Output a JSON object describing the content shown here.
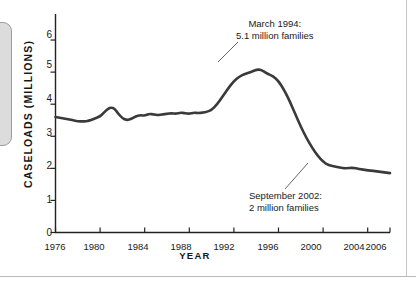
{
  "figure": {
    "left_tab_name": "page-edge-tab"
  },
  "chart_data": {
    "type": "line",
    "title": "",
    "xlabel": "YEAR",
    "ylabel": "CASELOADS (MILLIONS)",
    "xlim": [
      1976,
      2006
    ],
    "ylim": [
      0,
      6.5
    ],
    "grid": false,
    "legend": "none",
    "line_color": "#3a3a3a",
    "xticks": [
      1976,
      1980,
      1984,
      1988,
      1992,
      1996,
      2000,
      2004,
      2006
    ],
    "xtick_labels": [
      "1976",
      "1980",
      "1984",
      "1988",
      "1992",
      "1996",
      "2000",
      "2004",
      "2006"
    ],
    "yticks": [
      0,
      1,
      2,
      3,
      4,
      5,
      6
    ],
    "ytick_labels": [
      "0",
      "1",
      "2",
      "3",
      "4",
      "5",
      "6"
    ],
    "series": [
      {
        "name": "Welfare caseloads",
        "x": [
          1976.0,
          1976.5,
          1977.0,
          1977.5,
          1978.0,
          1978.5,
          1979.0,
          1979.5,
          1980.0,
          1980.3,
          1980.7,
          1981.0,
          1981.3,
          1981.6,
          1982.0,
          1982.4,
          1982.8,
          1983.2,
          1983.6,
          1984.0,
          1984.4,
          1984.8,
          1985.2,
          1985.6,
          1986.0,
          1986.4,
          1986.8,
          1987.2,
          1987.6,
          1988.0,
          1988.4,
          1988.8,
          1989.2,
          1989.6,
          1990.0,
          1990.5,
          1991.0,
          1991.5,
          1992.0,
          1992.5,
          1993.0,
          1993.5,
          1994.2,
          1994.7,
          1995.0,
          1995.5,
          1996.0,
          1996.5,
          1997.0,
          1997.5,
          1998.0,
          1998.5,
          1999.0,
          1999.5,
          2000.0,
          2000.5,
          2001.0,
          2001.5,
          2002.0,
          2002.7,
          2003.2,
          2004.0,
          2005.0,
          2006.0
        ],
        "y": [
          3.6,
          3.57,
          3.54,
          3.5,
          3.47,
          3.46,
          3.48,
          3.55,
          3.62,
          3.72,
          3.86,
          3.9,
          3.86,
          3.72,
          3.56,
          3.5,
          3.54,
          3.62,
          3.66,
          3.64,
          3.7,
          3.68,
          3.66,
          3.68,
          3.7,
          3.72,
          3.7,
          3.74,
          3.72,
          3.7,
          3.74,
          3.72,
          3.74,
          3.76,
          3.82,
          4.0,
          4.25,
          4.5,
          4.72,
          4.86,
          4.95,
          5.0,
          5.1,
          5.02,
          4.95,
          4.88,
          4.72,
          4.45,
          4.1,
          3.7,
          3.3,
          2.95,
          2.65,
          2.4,
          2.2,
          2.1,
          2.06,
          2.02,
          2.0,
          2.02,
          1.98,
          1.94,
          1.9,
          1.85
        ]
      }
    ],
    "annotations": [
      {
        "name": "peak-annotation",
        "line1": "March 1994:",
        "line2": "5.1 million families",
        "point_x": 1994.2,
        "point_y": 5.1
      },
      {
        "name": "trough-annotation",
        "line1": "September 2002:",
        "line2": "2 million families",
        "point_x": 2002.0,
        "point_y": 2.0
      }
    ]
  }
}
